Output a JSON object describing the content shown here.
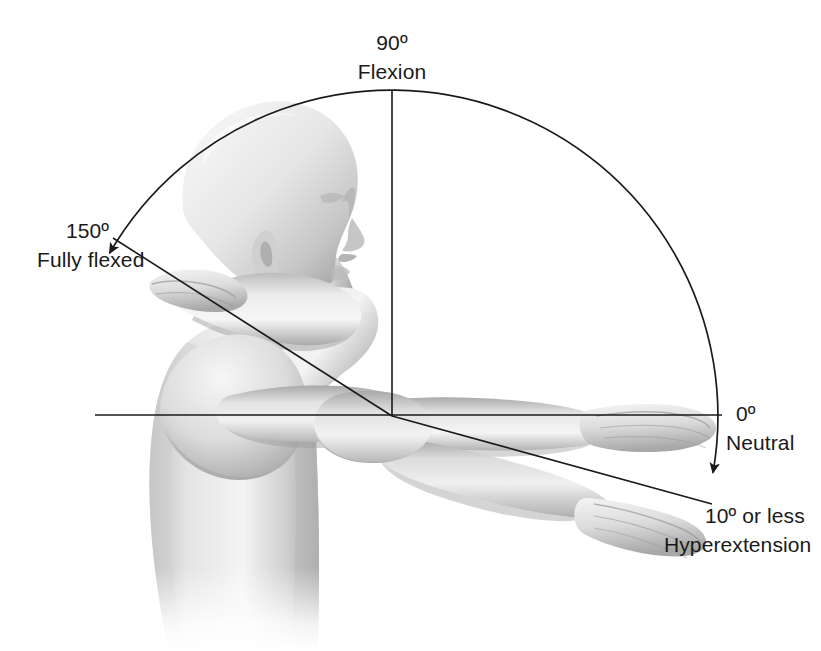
{
  "figure": {
    "ink_color": "#1a1a1a",
    "background_color": "#ffffff",
    "skin_tone_light": "#f2f2f2",
    "skin_tone_mid": "#c9c9c9",
    "skin_tone_dark": "#8f8f8f"
  },
  "labels": {
    "flexion_angle": "90º",
    "flexion_name": "Flexion",
    "fully_flexed_angle": "150º",
    "fully_flexed_name": "Fully flexed",
    "neutral_angle": "0º",
    "neutral_name": "Neutral",
    "hyperextension_angle": "10º or less",
    "hyperextension_name": "Hyperextension"
  },
  "chart_data": {
    "type": "scatter",
    "xlabel": "",
    "ylabel": "",
    "pivot": {
      "x": 392,
      "y": 416,
      "name": "elbow-joint"
    },
    "radius": 326,
    "arc": {
      "start_angle_deg": 150,
      "end_angle_deg": -10,
      "sweep_deg": 160,
      "arrowheads": [
        "150",
        "-10"
      ]
    },
    "categories": [
      "Fully flexed",
      "Flexion",
      "Neutral",
      "Hyperextension"
    ],
    "values": [
      150,
      90,
      0,
      -10
    ],
    "annotations": [
      {
        "angle": 150,
        "label": "150º",
        "sublabel": "Fully flexed",
        "x": 66,
        "y": 220
      },
      {
        "angle": 90,
        "label": "90º",
        "sublabel": "Flexion",
        "x": 392,
        "y": 32
      },
      {
        "angle": 0,
        "label": "0º",
        "sublabel": "Neutral",
        "x": 736,
        "y": 403
      },
      {
        "angle": -10,
        "label": "10º or less",
        "sublabel": "Hyperextension",
        "x": 705,
        "y": 505
      }
    ],
    "reference_lines": [
      {
        "name": "neutral-horizontal-line",
        "angle": 0,
        "from": [
          95,
          415
        ],
        "to": [
          722,
          415
        ]
      },
      {
        "name": "flexion-vertical-line",
        "angle": 90,
        "from": [
          392,
          416
        ],
        "to": [
          392,
          90
        ]
      },
      {
        "name": "fully-flexed-arm-line",
        "angle": 150,
        "from": [
          392,
          416
        ],
        "to": [
          113,
          238
        ]
      },
      {
        "name": "hyperextension-arm-line",
        "angle": -10,
        "from": [
          392,
          416
        ],
        "to": [
          712,
          504
        ]
      }
    ],
    "grid": false,
    "legend": "none"
  }
}
